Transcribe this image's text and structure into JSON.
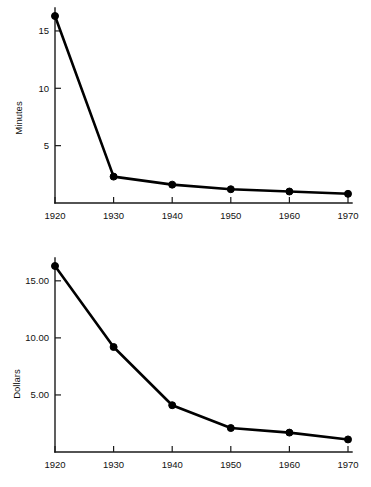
{
  "page": {
    "background": "#ffffff",
    "ink_color": "#000000",
    "width": 371,
    "height": 487
  },
  "chart_data": [
    {
      "id": "minutes",
      "type": "line",
      "title": "",
      "xlabel": "",
      "ylabel": "Minutes",
      "x": [
        1920,
        1930,
        1940,
        1950,
        1960,
        1970
      ],
      "xticklabels": [
        "1920",
        "1930",
        "1940",
        "1950",
        "1960",
        "1970"
      ],
      "values": [
        16.3,
        2.3,
        1.6,
        1.2,
        1.0,
        0.8
      ],
      "yticks": [
        5,
        10,
        15
      ],
      "yticklabels": [
        "5",
        "10",
        "15"
      ],
      "xlim": [
        1920,
        1970
      ],
      "ylim": [
        0,
        17
      ],
      "grid": false,
      "legend": false,
      "marker": "filled-circle",
      "line_color": "#000000"
    },
    {
      "id": "dollars",
      "type": "line",
      "title": "",
      "xlabel": "",
      "ylabel": "Dollars",
      "x": [
        1920,
        1930,
        1940,
        1950,
        1960,
        1970
      ],
      "xticklabels": [
        "1920",
        "1930",
        "1940",
        "1950",
        "1960",
        "1970"
      ],
      "values": [
        16.3,
        9.2,
        4.1,
        2.1,
        1.7,
        1.1
      ],
      "yticks": [
        5,
        10,
        15
      ],
      "yticklabels": [
        "5.00",
        "10.00",
        "15.00"
      ],
      "xlim": [
        1920,
        1970
      ],
      "ylim": [
        0,
        17
      ],
      "grid": false,
      "legend": false,
      "marker": "filled-circle",
      "line_color": "#000000"
    }
  ]
}
